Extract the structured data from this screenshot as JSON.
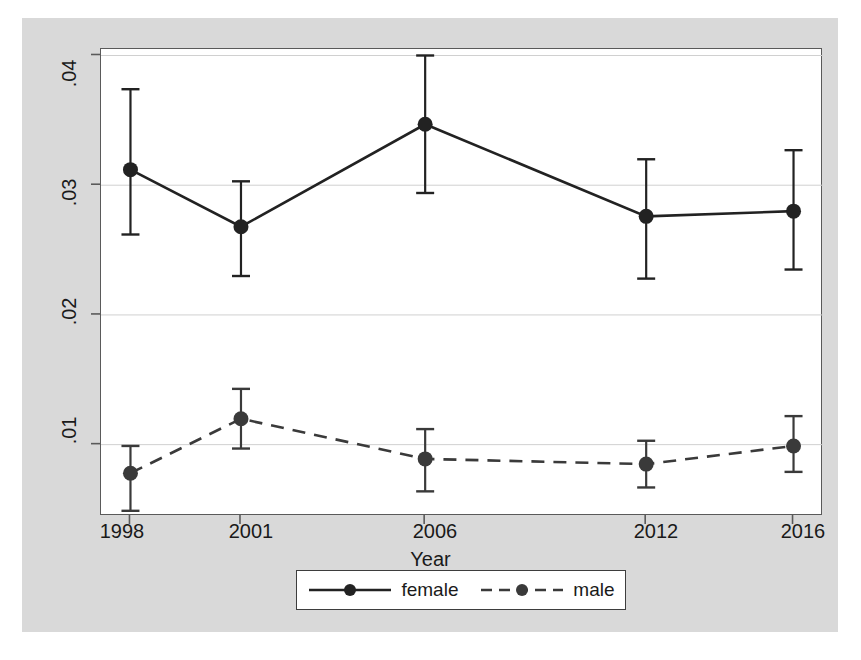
{
  "chart_data": {
    "type": "line",
    "title": "",
    "xlabel": "Year",
    "ylabel": "Linear Prediction",
    "categories": [
      "1998",
      "2001",
      "2006",
      "2012",
      "2016"
    ],
    "x": [
      1998,
      2001,
      2006,
      2012,
      2016
    ],
    "xlim": [
      1997.2,
      2016.8
    ],
    "ylim": [
      0.0045,
      0.0405
    ],
    "ytick_labels": [
      ".01",
      ".02",
      ".03",
      ".04"
    ],
    "ytick_values": [
      0.01,
      0.02,
      0.03,
      0.04
    ],
    "xtick_labels": [
      "1998",
      "2001",
      "2006",
      "2012",
      "2016"
    ],
    "grid": "horizontal",
    "legend_position": "bottom",
    "error_bars": true,
    "series": [
      {
        "name": "female",
        "style": "solid",
        "marker": "filled-circle",
        "color": "#222222",
        "values": [
          0.0312,
          0.0268,
          0.0347,
          0.0276,
          0.028
        ],
        "ci_low": [
          0.0262,
          0.023,
          0.0294,
          0.0228,
          0.0235
        ],
        "ci_high": [
          0.0374,
          0.0303,
          0.04,
          0.032,
          0.0327
        ]
      },
      {
        "name": "male",
        "style": "dashed",
        "marker": "filled-circle",
        "color": "#3a3a3a",
        "values": [
          0.0078,
          0.012,
          0.0089,
          0.0085,
          0.0099
        ],
        "ci_low": [
          0.0049,
          0.0097,
          0.0064,
          0.0067,
          0.0079
        ],
        "ci_high": [
          0.0099,
          0.0143,
          0.0112,
          0.0103,
          0.0122
        ]
      }
    ]
  },
  "axes": {
    "y_title": "Linear Prediction",
    "x_title": "Year",
    "y_ticks": [
      {
        "label": ".04"
      },
      {
        "label": ".03"
      },
      {
        "label": ".02"
      },
      {
        "label": ".01"
      }
    ],
    "x_ticks": [
      {
        "label": "1998"
      },
      {
        "label": "2001"
      },
      {
        "label": "2006"
      },
      {
        "label": "2012"
      },
      {
        "label": "2016"
      }
    ]
  },
  "legend": {
    "entries": [
      {
        "label": "female"
      },
      {
        "label": "male"
      }
    ]
  },
  "colors": {
    "backdrop": "#d9d9d9",
    "plot_background": "#ffffff",
    "series_female": "#222222",
    "series_male": "#3a3a3a",
    "gridline": "#d0d0d0",
    "axis": "#5a5a5a"
  }
}
